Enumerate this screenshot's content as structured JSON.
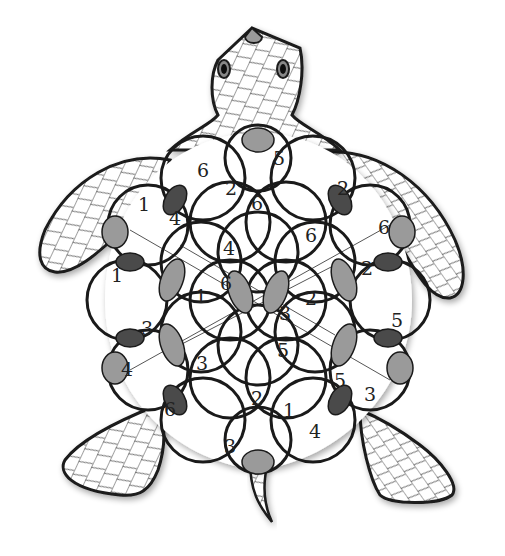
{
  "figure": {
    "colors": {
      "outline": "#1a1a1a",
      "segment_light": "#9a9a9a",
      "segment_dark": "#4a4a4a",
      "background": "#ffffff",
      "hatch": "#333333"
    }
  },
  "labels": [
    {
      "value": "6",
      "x": 203,
      "y": 170
    },
    {
      "value": "5",
      "x": 279,
      "y": 158
    },
    {
      "value": "2",
      "x": 231,
      "y": 188
    },
    {
      "value": "6",
      "x": 257,
      "y": 203
    },
    {
      "value": "2",
      "x": 343,
      "y": 188
    },
    {
      "value": "1",
      "x": 144,
      "y": 204
    },
    {
      "value": "4",
      "x": 175,
      "y": 218
    },
    {
      "value": "6",
      "x": 384,
      "y": 227
    },
    {
      "value": "6",
      "x": 311,
      "y": 235
    },
    {
      "value": "4",
      "x": 229,
      "y": 248
    },
    {
      "value": "2",
      "x": 367,
      "y": 268
    },
    {
      "value": "1",
      "x": 117,
      "y": 275
    },
    {
      "value": "6",
      "x": 226,
      "y": 283
    },
    {
      "value": "1",
      "x": 201,
      "y": 296
    },
    {
      "value": "2",
      "x": 311,
      "y": 298
    },
    {
      "value": "3",
      "x": 285,
      "y": 313
    },
    {
      "value": "5",
      "x": 397,
      "y": 320
    },
    {
      "value": "3",
      "x": 147,
      "y": 328
    },
    {
      "value": "5",
      "x": 283,
      "y": 350
    },
    {
      "value": "3",
      "x": 202,
      "y": 363
    },
    {
      "value": "4",
      "x": 127,
      "y": 369
    },
    {
      "value": "5",
      "x": 340,
      "y": 380
    },
    {
      "value": "3",
      "x": 370,
      "y": 394
    },
    {
      "value": "2",
      "x": 257,
      "y": 398
    },
    {
      "value": "6",
      "x": 170,
      "y": 409
    },
    {
      "value": "1",
      "x": 289,
      "y": 410
    },
    {
      "value": "4",
      "x": 315,
      "y": 431
    },
    {
      "value": "3",
      "x": 230,
      "y": 446
    }
  ]
}
